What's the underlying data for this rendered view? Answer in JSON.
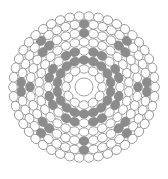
{
  "figure": {
    "type": "cross-section packing diagram",
    "symmetry": 8,
    "center": {
      "x": 84,
      "y": 87
    },
    "colors": {
      "background": "#ffffff",
      "outline": "#8a8a8a",
      "open_fill": "#ffffff",
      "shaded_fill": "#8c8c8c"
    },
    "core": {
      "r": 9
    },
    "rings": [
      {
        "name": "ring-1",
        "radius": 18,
        "count": 12,
        "rx": 4.2,
        "ry": 5.2
      },
      {
        "name": "ring-2",
        "radius": 27,
        "count": 18,
        "rx": 4.2,
        "ry": 5.0
      },
      {
        "name": "ring-3",
        "radius": 36,
        "count": 24,
        "rx": 4.2,
        "ry": 5.0
      },
      {
        "name": "ring-4",
        "radius": 45,
        "count": 30,
        "rx": 4.2,
        "ry": 5.0
      },
      {
        "name": "ring-5",
        "radius": 54,
        "count": 36,
        "rx": 4.3,
        "ry": 5.0
      },
      {
        "name": "ring-6",
        "radius": 63,
        "count": 42,
        "rx": 4.3,
        "ry": 5.0
      },
      {
        "name": "ring-7",
        "radius": 71,
        "count": 46,
        "rx": 4.3,
        "ry": 5.0
      }
    ],
    "shaded_groups": [
      {
        "name": "inner-cluster",
        "radius": 31,
        "angles": [
          22.5,
          67.5,
          112.5,
          157.5,
          202.5,
          247.5,
          292.5,
          337.5
        ],
        "spread": 11
      },
      {
        "name": "outer-cluster",
        "radius": 59,
        "angles": [
          0,
          45,
          90,
          135,
          180,
          225,
          270,
          315
        ],
        "spread": 7
      }
    ]
  }
}
